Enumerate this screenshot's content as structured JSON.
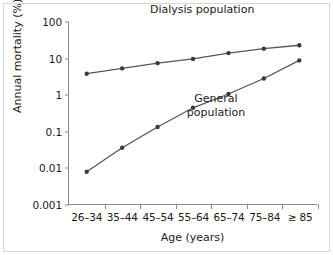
{
  "chart_data": {
    "type": "line",
    "title": "",
    "xlabel": "Age (years)",
    "ylabel": "Annual mortality (%)",
    "categories": [
      "26–34",
      "35–44",
      "45–54",
      "55–64",
      "65–74",
      "75–84",
      "≥ 85"
    ],
    "yscale": "log",
    "ylim": [
      0.001,
      100
    ],
    "yticks": [
      100,
      10,
      1,
      0.1,
      0.01,
      0.001
    ],
    "ytick_labels": [
      "100",
      "10",
      "1",
      "0.1",
      "0.01",
      "0.001"
    ],
    "grid": false,
    "legend": "annotations-inline",
    "series": [
      {
        "name": "Dialysis population",
        "values": [
          3.8,
          5.3,
          7.4,
          9.7,
          14.0,
          18.5,
          23.0
        ],
        "color": "#555555"
      },
      {
        "name": "General population",
        "values": [
          0.0077,
          0.035,
          0.13,
          0.44,
          1.05,
          2.8,
          8.8
        ],
        "color": "#555555"
      }
    ],
    "annotations": [
      {
        "text": "Dialysis population",
        "target": "dialysis-series"
      },
      {
        "text": "General\npopulation",
        "line1": "General",
        "line2": "population",
        "target": "general-series"
      }
    ]
  },
  "colors": {
    "line": "#555555",
    "marker": "#3a3a3a",
    "axis": "#8a8a8a",
    "text": "#1a1a1a",
    "background": "#ffffff",
    "border": "#d8d8d8"
  }
}
